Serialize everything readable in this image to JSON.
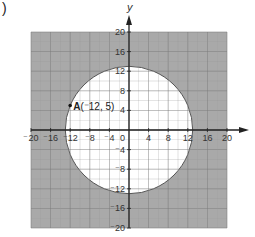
{
  "figure": {
    "part_marker": ")",
    "x_axis_label": "",
    "y_axis_label": "y",
    "origin_label": "0",
    "x_ticks": [
      {
        "value": -20,
        "label": "⁻20"
      },
      {
        "value": -16,
        "label": "⁻16"
      },
      {
        "value": -12,
        "label": "⁻12"
      },
      {
        "value": -8,
        "label": "⁻8"
      },
      {
        "value": -4,
        "label": "⁻4"
      },
      {
        "value": 4,
        "label": "4"
      },
      {
        "value": 8,
        "label": "8"
      },
      {
        "value": 12,
        "label": "12"
      },
      {
        "value": 16,
        "label": "16"
      },
      {
        "value": 20,
        "label": "20"
      }
    ],
    "y_ticks": [
      {
        "value": 20,
        "label": "20"
      },
      {
        "value": 16,
        "label": "16"
      },
      {
        "value": 12,
        "label": "12"
      },
      {
        "value": 8,
        "label": "8"
      },
      {
        "value": 4,
        "label": "4"
      },
      {
        "value": -4,
        "label": "⁻4"
      },
      {
        "value": -8,
        "label": "⁻8"
      },
      {
        "value": -12,
        "label": "⁻12"
      },
      {
        "value": -16,
        "label": "⁻16"
      },
      {
        "value": -20,
        "label": "⁻20"
      }
    ],
    "point": {
      "name": "A",
      "coords": "(⁻12, 5)",
      "x": -12,
      "y": 5
    },
    "circle": {
      "center_x": 0,
      "center_y": 0,
      "radius": 13
    },
    "grid": {
      "min": -20,
      "max": 20,
      "step": 2
    },
    "colors": {
      "shaded": "#a9a9a9",
      "grid_line": "#7a7a7a",
      "grid_line_light": "#c8c8c8",
      "axis": "#222222",
      "text": "#333333",
      "circle_fill": "#ffffff"
    }
  }
}
